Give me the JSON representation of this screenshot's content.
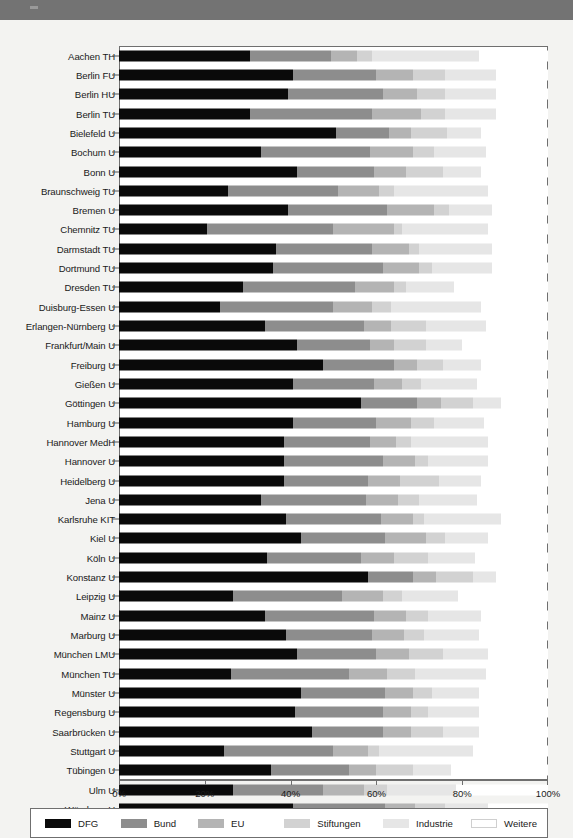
{
  "chart_data": {
    "type": "bar",
    "subtype": "horizontal-stacked-100-percent",
    "title": "",
    "xlabel": "",
    "ylabel": "",
    "xlim": [
      0,
      100
    ],
    "xticks": [
      "0%",
      "20%",
      "40%",
      "60%",
      "80%",
      "100%"
    ],
    "xtick_values": [
      0,
      20,
      40,
      60,
      80,
      100
    ],
    "grid": false,
    "legend_position": "bottom",
    "series": [
      {
        "name": "DFG",
        "color": "#0a0a0a"
      },
      {
        "name": "Bund",
        "color": "#8d8d8d"
      },
      {
        "name": "EU",
        "color": "#b4b4b4"
      },
      {
        "name": "Stiftungen",
        "color": "#d2d2d2"
      },
      {
        "name": "Industrie",
        "color": "#e6e6e6"
      },
      {
        "name": "Weitere",
        "color": "#ffffff"
      }
    ],
    "categories": [
      "Aachen TH",
      "Berlin FU",
      "Berlin HU",
      "Berlin TU",
      "Bielefeld U",
      "Bochum U",
      "Bonn U",
      "Braunschweig TU",
      "Bremen U",
      "Chemnitz TU",
      "Darmstadt TU",
      "Dortmund TU",
      "Dresden TU",
      "Duisburg-Essen U",
      "Erlangen-Nürnberg U",
      "Frankfurt/Main U",
      "Freiburg U",
      "Gießen U",
      "Göttingen U",
      "Hamburg U",
      "Hannover MedH",
      "Hannover U",
      "Heidelberg U",
      "Jena U",
      "Karlsruhe KIT",
      "Kiel U",
      "Köln U",
      "Konstanz U",
      "Leipzig U",
      "Mainz U",
      "Marburg U",
      "München LMU",
      "München TU",
      "Münster U",
      "Regensburg U",
      "Saarbrücken U",
      "Stuttgart U",
      "Tübingen U",
      "Ulm U",
      "Würzburg U"
    ],
    "rows": [
      {
        "label": "Aachen TH",
        "DFG": 30.5,
        "Bund": 19.0,
        "EU": 6.0,
        "Stiftungen": 3.5,
        "Industrie": 25.0,
        "Weitere": 16.0
      },
      {
        "label": "Berlin FU",
        "DFG": 40.5,
        "Bund": 19.5,
        "EU": 8.5,
        "Stiftungen": 7.5,
        "Industrie": 12.0,
        "Weitere": 12.0
      },
      {
        "label": "Berlin HU",
        "DFG": 39.5,
        "Bund": 22.0,
        "EU": 8.0,
        "Stiftungen": 6.5,
        "Industrie": 12.0,
        "Weitere": 12.0
      },
      {
        "label": "Berlin TU",
        "DFG": 30.5,
        "Bund": 28.5,
        "EU": 11.5,
        "Stiftungen": 5.5,
        "Industrie": 12.0,
        "Weitere": 12.0
      },
      {
        "label": "Bielefeld U",
        "DFG": 50.5,
        "Bund": 12.5,
        "EU": 5.0,
        "Stiftungen": 8.5,
        "Industrie": 8.0,
        "Weitere": 15.5
      },
      {
        "label": "Bochum U",
        "DFG": 33.0,
        "Bund": 25.5,
        "EU": 10.0,
        "Stiftungen": 5.0,
        "Industrie": 12.0,
        "Weitere": 14.5
      },
      {
        "label": "Bonn U",
        "DFG": 41.5,
        "Bund": 18.0,
        "EU": 7.5,
        "Stiftungen": 8.5,
        "Industrie": 9.0,
        "Weitere": 15.5
      },
      {
        "label": "Braunschweig TU",
        "DFG": 25.5,
        "Bund": 25.5,
        "EU": 9.5,
        "Stiftungen": 3.5,
        "Industrie": 22.0,
        "Weitere": 14.0
      },
      {
        "label": "Bremen U",
        "DFG": 39.5,
        "Bund": 23.0,
        "EU": 11.0,
        "Stiftungen": 3.5,
        "Industrie": 10.0,
        "Weitere": 13.0
      },
      {
        "label": "Chemnitz TU",
        "DFG": 20.5,
        "Bund": 29.5,
        "EU": 14.0,
        "Stiftungen": 2.0,
        "Industrie": 20.0,
        "Weitere": 14.0
      },
      {
        "label": "Darmstadt TU",
        "DFG": 36.5,
        "Bund": 22.5,
        "EU": 8.5,
        "Stiftungen": 2.5,
        "Industrie": 17.0,
        "Weitere": 13.0
      },
      {
        "label": "Dortmund TU",
        "DFG": 36.0,
        "Bund": 25.5,
        "EU": 8.5,
        "Stiftungen": 3.0,
        "Industrie": 14.0,
        "Weitere": 13.0
      },
      {
        "label": "Dresden TU",
        "DFG": 29.0,
        "Bund": 26.0,
        "EU": 9.0,
        "Stiftungen": 3.0,
        "Industrie": 11.0,
        "Weitere": 22.0
      },
      {
        "label": "Duisburg-Essen U",
        "DFG": 23.5,
        "Bund": 26.5,
        "EU": 9.0,
        "Stiftungen": 4.5,
        "Industrie": 21.0,
        "Weitere": 15.5
      },
      {
        "label": "Erlangen-Nürnberg U",
        "DFG": 34.0,
        "Bund": 23.0,
        "EU": 6.5,
        "Stiftungen": 8.0,
        "Industrie": 14.0,
        "Weitere": 14.5
      },
      {
        "label": "Frankfurt/Main U",
        "DFG": 41.5,
        "Bund": 17.0,
        "EU": 5.5,
        "Stiftungen": 7.5,
        "Industrie": 8.5,
        "Weitere": 20.0
      },
      {
        "label": "Freiburg U",
        "DFG": 47.5,
        "Bund": 16.5,
        "EU": 5.5,
        "Stiftungen": 6.0,
        "Industrie": 9.0,
        "Weitere": 15.5
      },
      {
        "label": "Gießen U",
        "DFG": 40.5,
        "Bund": 19.0,
        "EU": 6.5,
        "Stiftungen": 4.5,
        "Industrie": 13.0,
        "Weitere": 16.5
      },
      {
        "label": "Göttingen U",
        "DFG": 56.5,
        "Bund": 13.0,
        "EU": 5.5,
        "Stiftungen": 7.5,
        "Industrie": 6.5,
        "Weitere": 11.0
      },
      {
        "label": "Hamburg U",
        "DFG": 40.5,
        "Bund": 19.5,
        "EU": 8.0,
        "Stiftungen": 5.5,
        "Industrie": 11.5,
        "Weitere": 15.0
      },
      {
        "label": "Hannover MedH",
        "DFG": 38.5,
        "Bund": 20.0,
        "EU": 6.0,
        "Stiftungen": 3.5,
        "Industrie": 18.0,
        "Weitere": 14.0
      },
      {
        "label": "Hannover U",
        "DFG": 38.5,
        "Bund": 23.0,
        "EU": 7.5,
        "Stiftungen": 3.0,
        "Industrie": 14.0,
        "Weitere": 14.0
      },
      {
        "label": "Heidelberg U",
        "DFG": 38.5,
        "Bund": 19.5,
        "EU": 7.5,
        "Stiftungen": 9.0,
        "Industrie": 10.0,
        "Weitere": 15.5
      },
      {
        "label": "Jena U",
        "DFG": 33.0,
        "Bund": 24.5,
        "EU": 7.5,
        "Stiftungen": 5.0,
        "Industrie": 13.5,
        "Weitere": 16.5
      },
      {
        "label": "Karlsruhe KIT",
        "DFG": 39.0,
        "Bund": 22.0,
        "EU": 7.5,
        "Stiftungen": 2.5,
        "Industrie": 18.0,
        "Weitere": 11.0
      },
      {
        "label": "Kiel U",
        "DFG": 42.5,
        "Bund": 19.5,
        "EU": 9.5,
        "Stiftungen": 4.5,
        "Industrie": 10.0,
        "Weitere": 14.0
      },
      {
        "label": "Köln U",
        "DFG": 34.5,
        "Bund": 22.0,
        "EU": 7.5,
        "Stiftungen": 8.0,
        "Industrie": 11.0,
        "Weitere": 17.0
      },
      {
        "label": "Konstanz U",
        "DFG": 58.0,
        "Bund": 10.5,
        "EU": 5.5,
        "Stiftungen": 8.5,
        "Industrie": 5.5,
        "Weitere": 12.0
      },
      {
        "label": "Leipzig U",
        "DFG": 26.5,
        "Bund": 25.5,
        "EU": 9.5,
        "Stiftungen": 4.5,
        "Industrie": 13.0,
        "Weitere": 21.0
      },
      {
        "label": "Mainz U",
        "DFG": 34.0,
        "Bund": 25.5,
        "EU": 7.5,
        "Stiftungen": 5.0,
        "Industrie": 12.5,
        "Weitere": 15.5
      },
      {
        "label": "Marburg U",
        "DFG": 39.0,
        "Bund": 20.0,
        "EU": 7.5,
        "Stiftungen": 4.5,
        "Industrie": 13.0,
        "Weitere": 16.0
      },
      {
        "label": "München LMU",
        "DFG": 41.5,
        "Bund": 18.5,
        "EU": 7.5,
        "Stiftungen": 8.0,
        "Industrie": 10.5,
        "Weitere": 14.0
      },
      {
        "label": "München TU",
        "DFG": 26.0,
        "Bund": 27.5,
        "EU": 9.0,
        "Stiftungen": 6.5,
        "Industrie": 16.5,
        "Weitere": 14.5
      },
      {
        "label": "Münster U",
        "DFG": 42.5,
        "Bund": 19.5,
        "EU": 6.5,
        "Stiftungen": 4.5,
        "Industrie": 11.0,
        "Weitere": 16.0
      },
      {
        "label": "Regensburg U",
        "DFG": 41.0,
        "Bund": 20.5,
        "EU": 6.5,
        "Stiftungen": 4.0,
        "Industrie": 12.0,
        "Weitere": 16.0
      },
      {
        "label": "Saarbrücken U",
        "DFG": 45.0,
        "Bund": 16.5,
        "EU": 6.5,
        "Stiftungen": 7.5,
        "Industrie": 8.5,
        "Weitere": 16.0
      },
      {
        "label": "Stuttgart U",
        "DFG": 24.5,
        "Bund": 25.5,
        "EU": 8.0,
        "Stiftungen": 2.5,
        "Industrie": 22.0,
        "Weitere": 17.5
      },
      {
        "label": "Tübingen U",
        "DFG": 35.5,
        "Bund": 18.0,
        "EU": 6.5,
        "Stiftungen": 8.5,
        "Industrie": 9.0,
        "Weitere": 22.5
      },
      {
        "label": "Ulm U",
        "DFG": 26.5,
        "Bund": 21.0,
        "EU": 9.5,
        "Stiftungen": 5.5,
        "Industrie": 16.0,
        "Weitere": 21.5
      },
      {
        "label": "Würzburg U",
        "DFG": 40.5,
        "Bund": 21.5,
        "EU": 7.0,
        "Stiftungen": 7.0,
        "Industrie": 10.0,
        "Weitere": 14.0
      }
    ]
  },
  "legend": {
    "items": [
      {
        "label": "DFG"
      },
      {
        "label": "Bund"
      },
      {
        "label": "EU"
      },
      {
        "label": "Stiftungen"
      },
      {
        "label": "Industrie"
      },
      {
        "label": "Weitere"
      }
    ]
  },
  "axis": {
    "ticks": [
      {
        "label": "0%"
      },
      {
        "label": "20%"
      },
      {
        "label": "40%"
      },
      {
        "label": "60%"
      },
      {
        "label": "80%"
      },
      {
        "label": "100%"
      }
    ]
  }
}
